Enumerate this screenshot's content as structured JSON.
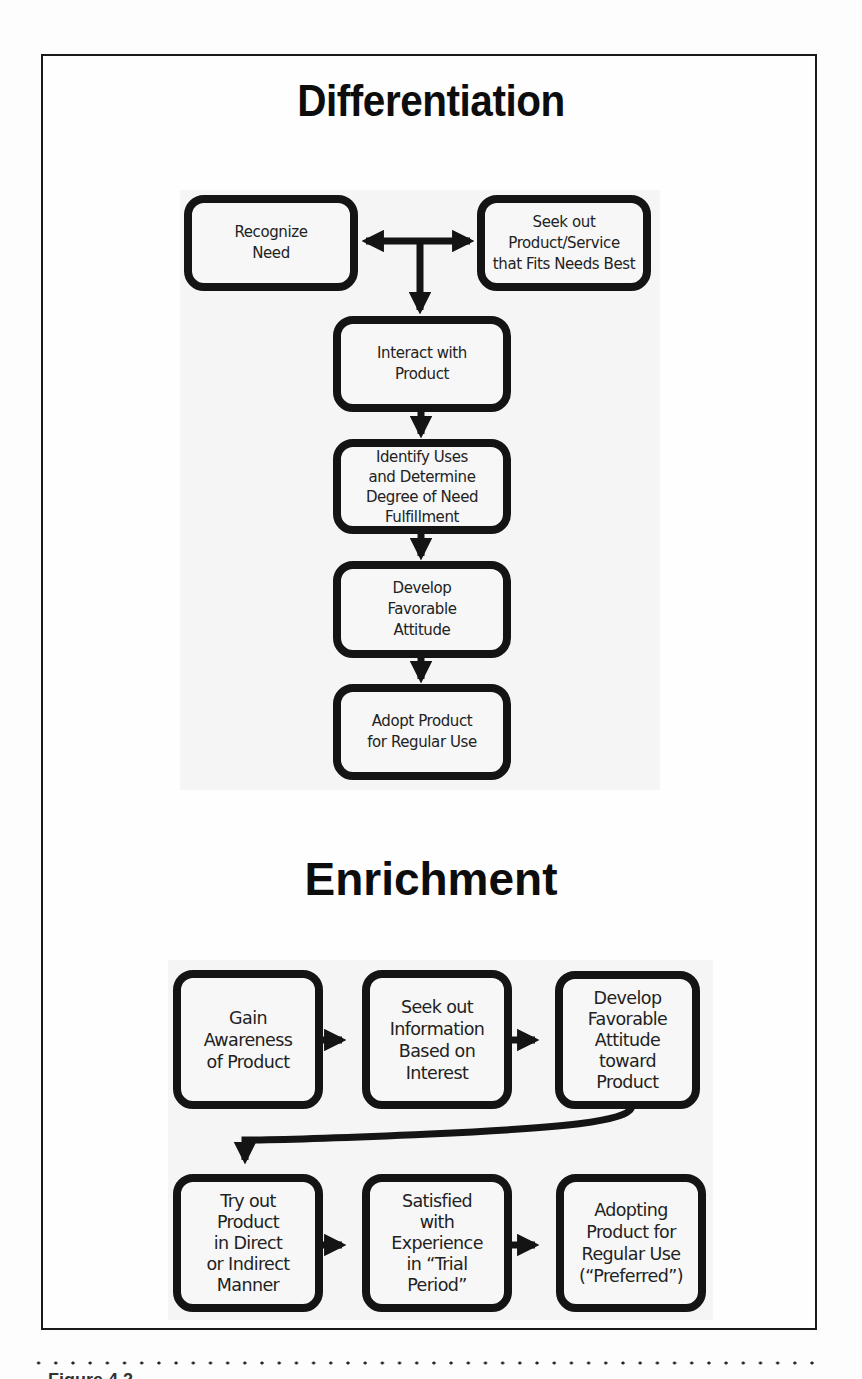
{
  "figure": {
    "caption_partial": "Figure 4.2",
    "colors": {
      "box_border": "#141414",
      "box_fill": "#f7f7f7",
      "arrow": "#141414",
      "frame_border": "#1a1a1a",
      "background": "#fdfdfd"
    }
  },
  "differentiation": {
    "title": "Differentiation",
    "nodes": [
      {
        "id": "recognize-need",
        "label": "Recognize\nNeed"
      },
      {
        "id": "seek-product",
        "label": "Seek out\nProduct/Service\nthat Fits Needs Best"
      },
      {
        "id": "interact",
        "label": "Interact with\nProduct"
      },
      {
        "id": "identify-uses",
        "label": "Identify Uses\nand Determine\nDegree of Need\nFulfillment"
      },
      {
        "id": "develop-attitude",
        "label": "Develop\nFavorable\nAttitude"
      },
      {
        "id": "adopt-product",
        "label": "Adopt Product\nfor Regular Use"
      }
    ],
    "edges": [
      {
        "from": "recognize-need",
        "to": "seek-product",
        "type": "bidirectional"
      },
      {
        "from": "junction",
        "to": "interact"
      },
      {
        "from": "interact",
        "to": "identify-uses"
      },
      {
        "from": "identify-uses",
        "to": "develop-attitude"
      },
      {
        "from": "develop-attitude",
        "to": "adopt-product"
      }
    ]
  },
  "enrichment": {
    "title": "Enrichment",
    "nodes": [
      {
        "id": "gain-awareness",
        "label": "Gain\nAwareness\nof Product"
      },
      {
        "id": "seek-information",
        "label": "Seek out\nInformation\nBased on\nInterest"
      },
      {
        "id": "develop-attitude-product",
        "label": "Develop\nFavorable\nAttitude\ntoward\nProduct"
      },
      {
        "id": "try-out",
        "label": "Try out\nProduct\nin Direct\nor Indirect\nManner"
      },
      {
        "id": "satisfied",
        "label": "Satisfied\nwith\nExperience\nin “Trial\nPeriod”"
      },
      {
        "id": "adopting",
        "label": "Adopting\nProduct for\nRegular Use\n(“Preferred”)"
      }
    ],
    "edges": [
      {
        "from": "gain-awareness",
        "to": "seek-information"
      },
      {
        "from": "seek-information",
        "to": "develop-attitude-product"
      },
      {
        "from": "develop-attitude-product",
        "to": "try-out",
        "type": "curved"
      },
      {
        "from": "try-out",
        "to": "satisfied"
      },
      {
        "from": "satisfied",
        "to": "adopting"
      }
    ]
  }
}
